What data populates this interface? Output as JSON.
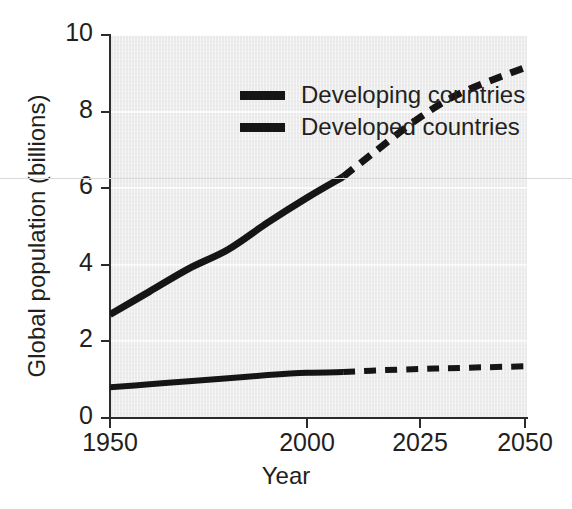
{
  "chart_data": {
    "type": "line",
    "title": "",
    "xlabel": "Year",
    "ylabel": "Global population (billions)",
    "xlim": [
      1950,
      2050
    ],
    "ylim": [
      0,
      10
    ],
    "xticks": [
      1950,
      2000,
      2025,
      2050
    ],
    "xtick_labels": [
      "1950",
      "2000",
      "2025",
      "2050"
    ],
    "yticks": [
      0,
      2,
      4,
      6,
      8,
      10
    ],
    "ytick_labels": [
      "0",
      "2",
      "4",
      "6",
      "8",
      "10"
    ],
    "x_axis_scale": "non-linear (1950-2000 compressed relative to 2000-2050)",
    "grid": "horizontal white gridlines at each y tick",
    "legend_position": "top-left inside plot",
    "projection_split_year": 2008,
    "note": "Solid segments are historical data; dashed segments are projections after 2008.",
    "series": [
      {
        "name": "Developing countries",
        "style": "solid then dashed",
        "line_color": "#151515",
        "x": [
          1950,
          1960,
          1970,
          1980,
          1990,
          2000,
          2008,
          2015,
          2025,
          2035,
          2050
        ],
        "values": [
          2.7,
          3.3,
          3.9,
          4.4,
          5.1,
          5.75,
          6.3,
          6.95,
          7.85,
          8.5,
          9.15
        ]
      },
      {
        "name": "Developed countries",
        "style": "solid then dashed",
        "line_color": "#151515",
        "x": [
          1950,
          1960,
          1970,
          1980,
          1990,
          2000,
          2008,
          2015,
          2025,
          2035,
          2050
        ],
        "values": [
          0.8,
          0.88,
          0.96,
          1.04,
          1.12,
          1.18,
          1.2,
          1.24,
          1.28,
          1.31,
          1.35
        ]
      }
    ]
  },
  "legend": {
    "items": [
      {
        "label": "Developing countries",
        "swatch": "thick-black-bar"
      },
      {
        "label": "Developed countries",
        "swatch": "thick-black-bar"
      }
    ]
  }
}
